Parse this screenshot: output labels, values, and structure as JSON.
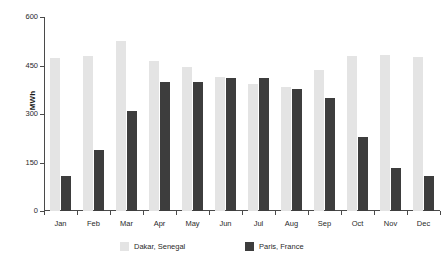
{
  "chart_data": {
    "type": "bar",
    "title": "",
    "xlabel": "",
    "ylabel": "MWh",
    "ylim": [
      0,
      600
    ],
    "yticks": [
      0,
      150,
      300,
      450,
      600
    ],
    "grid": false,
    "legend_position": "bottom",
    "categories": [
      "Jan",
      "Feb",
      "Mar",
      "Apr",
      "May",
      "Jun",
      "Jul",
      "Aug",
      "Sep",
      "Oct",
      "Nov",
      "Dec"
    ],
    "series": [
      {
        "name": "Dakar, Senegal",
        "color": "#e4e4e4",
        "values": [
          472,
          480,
          525,
          463,
          446,
          415,
          392,
          383,
          436,
          478,
          482,
          475
        ]
      },
      {
        "name": "Paris, France",
        "color": "#3d3d3d",
        "values": [
          108,
          188,
          310,
          399,
          400,
          411,
          410,
          378,
          348,
          228,
          134,
          108
        ]
      }
    ]
  },
  "axis": {
    "ytick_labels": [
      "0",
      "150",
      "300",
      "450",
      "600"
    ],
    "ylabel": "MWh"
  },
  "legend": {
    "items": [
      {
        "label": "Dakar, Senegal",
        "swatch": "light"
      },
      {
        "label": "Paris, France",
        "swatch": "dark"
      }
    ]
  }
}
